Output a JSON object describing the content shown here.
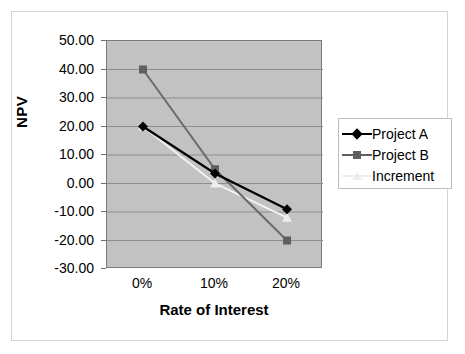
{
  "chart_data": {
    "type": "line",
    "title": "",
    "xlabel": "Rate of Interest",
    "ylabel": "NPV",
    "categories": [
      "0%",
      "10%",
      "20%"
    ],
    "x_values": [
      0,
      10,
      20
    ],
    "ylim": [
      -30,
      50
    ],
    "y_ticks": [
      50,
      40,
      30,
      20,
      10,
      0,
      -10,
      -20,
      -30
    ],
    "y_tick_labels": [
      "50.00",
      "40.00",
      "30.00",
      "20.00",
      "10.00",
      "0.00",
      "-10.00",
      "-20.00",
      "-30.00"
    ],
    "grid": "horizontal",
    "legend_position": "right",
    "plot_background": "#c2c2c2",
    "series": [
      {
        "name": "Project A",
        "values": [
          20,
          3.5,
          -9
        ],
        "color": "#000000",
        "marker": "diamond",
        "marker_color": "#000000"
      },
      {
        "name": "Project B",
        "values": [
          40,
          5,
          -20
        ],
        "color": "#6b6b6b",
        "marker": "square",
        "marker_color": "#5f5f5f"
      },
      {
        "name": "Increment",
        "values": [
          20,
          0,
          -12
        ],
        "color": "#f2f2f2",
        "marker": "triangle",
        "marker_color": "#ededed"
      }
    ]
  },
  "axes": {
    "y_title": "NPV",
    "x_title": "Rate of Interest",
    "y_labels": [
      "50.00",
      "40.00",
      "30.00",
      "20.00",
      "10.00",
      "0.00",
      "-10.00",
      "-20.00",
      "-30.00"
    ],
    "x_labels": [
      "0%",
      "10%",
      "20%"
    ]
  },
  "legend": {
    "items": [
      {
        "label": "Project A",
        "marker": "diamond-icon",
        "color": "#000000"
      },
      {
        "label": "Project B",
        "marker": "square-icon",
        "color": "#5f5f5f"
      },
      {
        "label": "Increment",
        "marker": "triangle-icon",
        "color": "#ededed"
      }
    ]
  }
}
